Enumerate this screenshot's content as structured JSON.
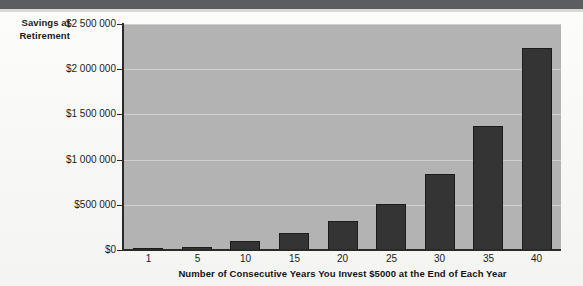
{
  "chart_data": {
    "type": "bar",
    "title": "",
    "xlabel": "Number of Consecutive Years You Invest $5000 at the End of Each Year",
    "ylabel": "Savings at Retirement",
    "categories": [
      "1",
      "5",
      "10",
      "15",
      "20",
      "25",
      "30",
      "35",
      "40"
    ],
    "values": [
      5000,
      30000,
      95000,
      190000,
      320000,
      510000,
      840000,
      1370000,
      2240000
    ],
    "ylim": [
      0,
      2500000
    ],
    "xlim_note": "categorical",
    "y_ticks": [
      0,
      500000,
      1000000,
      1500000,
      2000000,
      2500000
    ],
    "y_tick_labels": [
      "$0",
      "$500 000",
      "$1 000 000",
      "$1 500 000",
      "$2 000 000",
      "$2 500 000"
    ],
    "grid": true,
    "grid_axis": "y",
    "legend": false,
    "legend_position": "none",
    "bar_color": "#343434",
    "plot_background_color": "#b3b3b3",
    "gridline_color": "#cfcfcf",
    "axis_color": "#2a2a2a",
    "text_color": "#1b1b1b",
    "page_background_color": "#fbfbfa"
  },
  "axes": {
    "y_title_line1": "Savings at",
    "y_title_line2": "Retirement"
  }
}
